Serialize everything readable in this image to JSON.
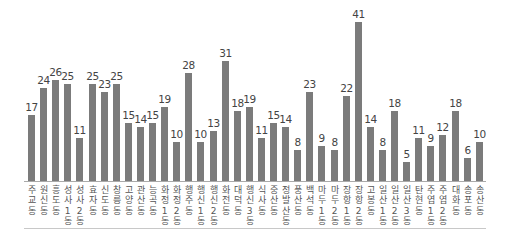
{
  "chart_data": {
    "type": "bar",
    "title": "",
    "xlabel": "",
    "ylabel": "",
    "ylim": [
      0,
      42
    ],
    "grid": false,
    "legend": null,
    "categories": [
      "주교동",
      "원신동",
      "흥도동",
      "성사1동",
      "성사2동",
      "효자동",
      "신도동",
      "창릉동",
      "고양동",
      "관산동",
      "능곡동",
      "화정1동",
      "화정2동",
      "행주동",
      "행신1동",
      "행신2동",
      "화전동",
      "대덕동",
      "행신3동",
      "식사동",
      "중산동",
      "정발산동",
      "풍산동",
      "백석동",
      "마두1동",
      "마두2동",
      "장항1동",
      "장항2동",
      "고봉동",
      "일산1동",
      "일산2동",
      "일산3동",
      "탄현동",
      "주엽1동",
      "주엽2동",
      "대화동",
      "송포동",
      "송산동"
    ],
    "values": [
      17,
      24,
      26,
      25,
      11,
      25,
      23,
      25,
      15,
      14,
      15,
      19,
      10,
      28,
      10,
      13,
      31,
      18,
      19,
      11,
      15,
      14,
      8,
      23,
      9,
      8,
      22,
      41,
      14,
      8,
      18,
      5,
      11,
      9,
      12,
      18,
      6,
      10
    ],
    "bar_color": "#7b7b7b"
  }
}
